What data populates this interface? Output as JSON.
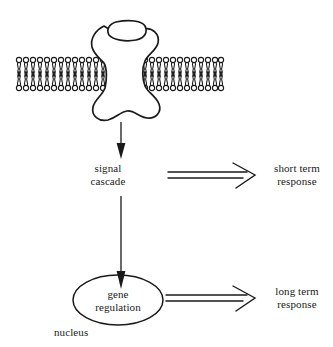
{
  "diagram": {
    "stroke_color": "#1a1a1a",
    "fill_color": "#ffffff",
    "background": "#ffffff",
    "labels": {
      "signal_cascade_line1": "signal",
      "signal_cascade_line2": "cascade",
      "gene_regulation_line1": "gene",
      "gene_regulation_line2": "regulation",
      "nucleus": "nucleus",
      "short_term_line1": "short term",
      "short_term_line2": "response",
      "long_term_line1": "long term",
      "long_term_line2": "response"
    },
    "structures": {
      "membrane": "lipid-bilayer",
      "receptor": "transmembrane-receptor-protein",
      "ligand": "bound-ligand",
      "nucleus_shape": "ellipse"
    },
    "arrows": {
      "receptor_to_cascade": "solid-down-arrow",
      "cascade_to_nucleus": "solid-down-arrow",
      "cascade_to_short_term": "open-right-arrow",
      "nucleus_to_long_term": "open-right-arrow"
    }
  }
}
